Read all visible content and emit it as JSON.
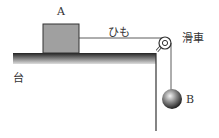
{
  "labels": {
    "block": "A",
    "string": "ひも",
    "pulley": "滑車",
    "table": "台",
    "ball": "B"
  },
  "colors": {
    "block_fill": "#a0a0a0",
    "line": "#333333",
    "ball": "#555555"
  }
}
